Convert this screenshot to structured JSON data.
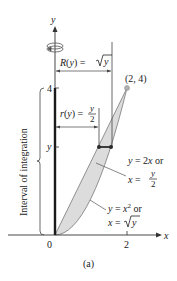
{
  "figure": {
    "caption": "(a)",
    "axes": {
      "x_label": "x",
      "y_label": "y",
      "origin_label": "0",
      "x_tick": "2",
      "y_tick_top": "4",
      "y_tick_var": "y"
    },
    "point_label": "(2, 4)",
    "outer_radius": {
      "lhs": "R(y) = ",
      "rhs": "y"
    },
    "inner_radius": {
      "lhs": "r(y) = ",
      "num": "y",
      "den": "2"
    },
    "line_label": {
      "line1": "y = 2x or",
      "line2_lhs": "x = ",
      "num": "y",
      "den": "2"
    },
    "curve_label": {
      "line1_lhs": "y = x",
      "exp": "2",
      "line1_rhs": " or",
      "line2_lhs": "x = ",
      "line2_rad": "y"
    },
    "interval_label": "Interval of integration",
    "colors": {
      "region_fill": "#dcdcdc",
      "axis": "#333333",
      "highlight_axis": "#1a1a1a",
      "point": "#b0b0b0",
      "washer": "#2a2a2a"
    }
  }
}
